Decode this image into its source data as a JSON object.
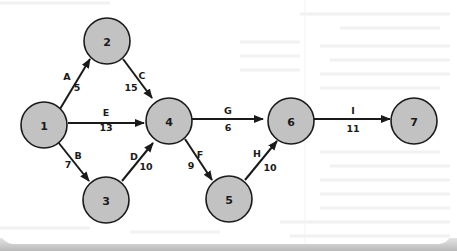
{
  "diagram": {
    "type": "activity-network",
    "colors": {
      "node_fill": "#c2c2c2",
      "node_stroke": "#1a1a1a",
      "edge": "#1a1a1a",
      "background": "#ffffff",
      "shadow": "#b9b9b9"
    },
    "nodes": [
      {
        "id": "1",
        "label": "1"
      },
      {
        "id": "2",
        "label": "2"
      },
      {
        "id": "3",
        "label": "3"
      },
      {
        "id": "4",
        "label": "4"
      },
      {
        "id": "5",
        "label": "5"
      },
      {
        "id": "6",
        "label": "6"
      },
      {
        "id": "7",
        "label": "7"
      }
    ],
    "edges": [
      {
        "from": "1",
        "to": "2",
        "activity": "A",
        "duration": "5"
      },
      {
        "from": "1",
        "to": "3",
        "activity": "B",
        "duration": "7"
      },
      {
        "from": "2",
        "to": "4",
        "activity": "C",
        "duration": "15"
      },
      {
        "from": "3",
        "to": "4",
        "activity": "D",
        "duration": "10"
      },
      {
        "from": "1",
        "to": "4",
        "activity": "E",
        "duration": "13"
      },
      {
        "from": "4",
        "to": "5",
        "activity": "F",
        "duration": "9"
      },
      {
        "from": "4",
        "to": "6",
        "activity": "G",
        "duration": "6"
      },
      {
        "from": "5",
        "to": "6",
        "activity": "H",
        "duration": "10"
      },
      {
        "from": "6",
        "to": "7",
        "activity": "I",
        "duration": "11"
      }
    ]
  }
}
